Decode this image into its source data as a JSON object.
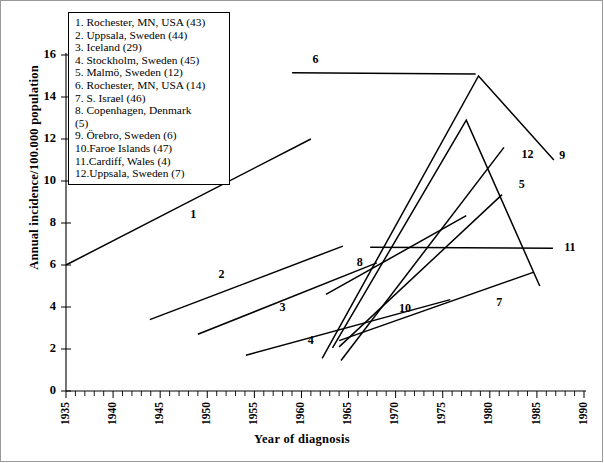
{
  "chart_data": {
    "type": "line",
    "title": "",
    "xlabel": "Year of diagnosis",
    "ylabel": "Annual incidence/100.000 population",
    "xlim": [
      1935,
      1990
    ],
    "ylim": [
      0,
      16
    ],
    "xticks": [
      1935,
      1940,
      1945,
      1950,
      1955,
      1960,
      1965,
      1970,
      1975,
      1980,
      1985,
      1990
    ],
    "xtick_labels": [
      "1935",
      "1940",
      "1945",
      "1950",
      "1955",
      "1960",
      "1965",
      "1970",
      "1975",
      "1980",
      "1985",
      "1990"
    ],
    "yticks": [
      0,
      2,
      4,
      6,
      8,
      10,
      12,
      14,
      16
    ],
    "ytick_labels": [
      "0",
      "2",
      "4",
      "6",
      "8",
      "10",
      "12",
      "14",
      "16"
    ],
    "minor_xtick_step": 1,
    "grid": false,
    "legend_position": "upper-left-inset",
    "series": [
      {
        "id": "1",
        "name": "Rochester, MN, USA (43)",
        "label": "1",
        "label_at": {
          "x": 1948.5,
          "y": 8.35
        },
        "points": [
          {
            "x": 1935.0,
            "y": 6.0
          },
          {
            "x": 1961.0,
            "y": 12.0
          }
        ]
      },
      {
        "id": "2",
        "name": "Uppsala, Sweden (44)",
        "label": "2",
        "label_at": {
          "x": 1951.5,
          "y": 5.5
        },
        "points": [
          {
            "x": 1943.9,
            "y": 3.4
          },
          {
            "x": 1964.4,
            "y": 6.9
          }
        ]
      },
      {
        "id": "3",
        "name": "Iceland (29)",
        "label": "3",
        "label_at": {
          "x": 1958.0,
          "y": 3.95
        },
        "points": [
          {
            "x": 1949.0,
            "y": 2.7
          },
          {
            "x": 1968.0,
            "y": 6.1
          }
        ]
      },
      {
        "id": "4",
        "name": "Stockholm, Sweden (45)",
        "label": "4",
        "label_at": {
          "x": 1961.0,
          "y": 2.35
        },
        "points": [
          {
            "x": 1954.1,
            "y": 1.7
          },
          {
            "x": 1975.8,
            "y": 4.35
          }
        ]
      },
      {
        "id": "5",
        "name": "Malmö, Sweden (12)",
        "label": "5",
        "label_at": {
          "x": 1983.4,
          "y": 9.8
        },
        "points": [
          {
            "x": 1964.0,
            "y": 2.1
          },
          {
            "x": 1981.3,
            "y": 9.35
          }
        ]
      },
      {
        "id": "6",
        "name": "Rochester, MN, USA (14)",
        "label": "6",
        "label_at": {
          "x": 1961.5,
          "y": 15.75
        },
        "points": [
          {
            "x": 1959.0,
            "y": 15.15
          },
          {
            "x": 1978.5,
            "y": 15.1
          }
        ]
      },
      {
        "id": "7",
        "name": "S. Israel (46)",
        "label": "7",
        "label_at": {
          "x": 1981.0,
          "y": 4.2
        },
        "points": [
          {
            "x": 1964.0,
            "y": 2.4
          },
          {
            "x": 1984.6,
            "y": 5.65
          }
        ]
      },
      {
        "id": "8",
        "name": "Copenhagen, Denmark (5)",
        "label": "8",
        "label_at": {
          "x": 1966.2,
          "y": 6.1
        },
        "points": [
          {
            "x": 1962.6,
            "y": 4.6
          },
          {
            "x": 1977.5,
            "y": 8.35
          }
        ]
      },
      {
        "id": "9",
        "name": "Örebro, Sweden (6)",
        "label": "9",
        "label_at": {
          "x": 1987.7,
          "y": 11.2
        },
        "points": [
          {
            "x": 1962.2,
            "y": 1.55
          },
          {
            "x": 1978.8,
            "y": 15.0
          },
          {
            "x": 1986.8,
            "y": 11.0
          }
        ]
      },
      {
        "id": "10",
        "name": "Faroe Islands (47)",
        "label": "10",
        "label_at": {
          "x": 1971.0,
          "y": 3.9
        },
        "points": [
          {
            "x": 1964.2,
            "y": 1.45
          },
          {
            "x": 1981.5,
            "y": 11.6
          }
        ]
      },
      {
        "id": "11",
        "name": "Cardiff, Wales (4)",
        "label": "11",
        "label_at": {
          "x": 1988.5,
          "y": 6.8
        },
        "points": [
          {
            "x": 1967.3,
            "y": 6.85
          },
          {
            "x": 1986.7,
            "y": 6.8
          }
        ]
      },
      {
        "id": "12",
        "name": "Uppsala, Sweden (7)",
        "label": "12",
        "label_at": {
          "x": 1984.0,
          "y": 11.25
        },
        "points": [
          {
            "x": 1963.3,
            "y": 2.05
          },
          {
            "x": 1977.5,
            "y": 12.9
          },
          {
            "x": 1985.3,
            "y": 5.0
          }
        ]
      }
    ]
  },
  "legend": {
    "name": "series-legend",
    "items": [
      "1. Rochester, MN, USA (43)",
      "2. Uppsala, Sweden (44)",
      "3. Iceland (29)",
      "4. Stockholm, Sweden (45)",
      "5. Malmö, Sweden (12)",
      "6. Rochester, MN, USA (14)",
      "7. S. Israel (46)",
      "8. Copenhagen, Denmark\n(5)",
      "9. Örebro, Sweden (6)",
      "10.Faroe Islands (47)",
      "11.Cardiff, Wales (4)",
      "12.Uppsala, Sweden (7)"
    ]
  },
  "colors": {
    "line": "#000000",
    "axis": "#000000",
    "background": "#ffffff",
    "frame": "#9a9a9a"
  }
}
